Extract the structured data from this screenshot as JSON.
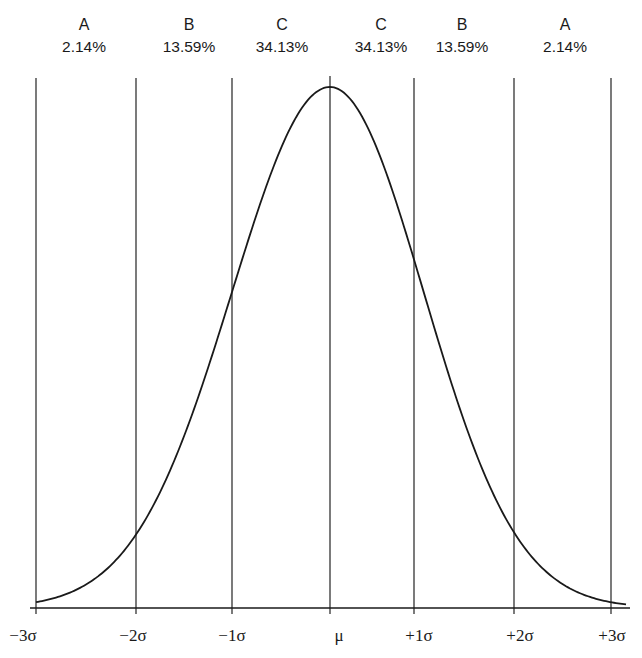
{
  "chart_data": {
    "type": "line",
    "title": "",
    "xlabel": "",
    "ylabel": "",
    "grid": false,
    "x_ticks": [
      "-3σ",
      "-2σ",
      "-1σ",
      "μ",
      "+1σ",
      "+2σ",
      "+3σ"
    ],
    "x_tick_values": [
      -3,
      -2,
      -1,
      0,
      1,
      2,
      3
    ],
    "xlim": [
      -3,
      3
    ],
    "bands": [
      {
        "range": [
          -3,
          -2
        ],
        "label": "A",
        "percent": "2.14%"
      },
      {
        "range": [
          -2,
          -1
        ],
        "label": "B",
        "percent": "13.59%"
      },
      {
        "range": [
          -1,
          0
        ],
        "label": "C",
        "percent": "34.13%"
      },
      {
        "range": [
          0,
          1
        ],
        "label": "C",
        "percent": "34.13%"
      },
      {
        "range": [
          1,
          2
        ],
        "label": "B",
        "percent": "13.59%"
      },
      {
        "range": [
          2,
          3
        ],
        "label": "A",
        "percent": "2.14%"
      }
    ],
    "series": [
      {
        "name": "normal density (relative)",
        "x": [
          -3,
          -2,
          -1,
          0,
          1,
          2,
          3
        ],
        "values": [
          0.011,
          0.135,
          0.607,
          1.0,
          0.607,
          0.135,
          0.011
        ]
      }
    ],
    "colors": {
      "line": "#1a1a1a",
      "background": "#ffffff"
    }
  },
  "labels": {
    "bands": [
      {
        "letter": "A",
        "pct": "2.14%"
      },
      {
        "letter": "B",
        "pct": "13.59%"
      },
      {
        "letter": "C",
        "pct": "34.13%"
      },
      {
        "letter": "C",
        "pct": "34.13%"
      },
      {
        "letter": "B",
        "pct": "13.59%"
      },
      {
        "letter": "A",
        "pct": "2.14%"
      }
    ],
    "ticks": [
      "−3σ",
      "−2σ",
      "−1σ",
      "μ",
      "+1σ",
      "+2σ",
      "+3σ"
    ]
  }
}
